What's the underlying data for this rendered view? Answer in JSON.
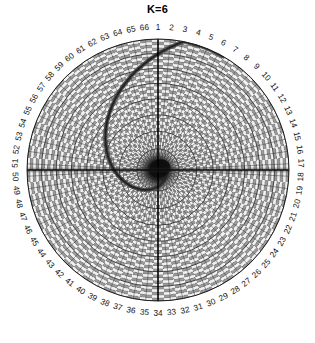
{
  "chart_data": {
    "type": "heatmap",
    "subtype": "polar-spiral-grid",
    "title": "K=6",
    "xlabel": "",
    "ylabel": "",
    "legend": null,
    "grid": true,
    "angular_axis": {
      "label": "",
      "direction": "clockwise",
      "zero_at": "top",
      "n_sectors": 66,
      "tick_labels": [
        "1",
        "2",
        "3",
        "4",
        "5",
        "6",
        "7",
        "8",
        "9",
        "10",
        "11",
        "12",
        "13",
        "14",
        "15",
        "16",
        "17",
        "18",
        "19",
        "20",
        "21",
        "22",
        "23",
        "24",
        "25",
        "26",
        "27",
        "28",
        "29",
        "30",
        "31",
        "32",
        "33",
        "34",
        "35",
        "36",
        "37",
        "38",
        "39",
        "40",
        "41",
        "42",
        "43",
        "44",
        "45",
        "46",
        "47",
        "48",
        "49",
        "50",
        "51",
        "52",
        "53",
        "54",
        "55",
        "56",
        "57",
        "58",
        "59",
        "60",
        "61",
        "62",
        "63",
        "64",
        "65",
        "66"
      ]
    },
    "radial_axis": {
      "label": "",
      "rlim": [
        0,
        1
      ],
      "n_rings": 40,
      "tick_labels": []
    },
    "annotations": [
      {
        "name": "dark-core",
        "description": "dark saturated region at pole",
        "r": 0.1
      },
      {
        "name": "spiral-arm",
        "description": "dark logarithmic spiral emanating clockwise from pole to rim"
      },
      {
        "name": "horizontal-axis-band",
        "description": "emphasized horizontal line across sectors 17-18 and 50-51"
      },
      {
        "name": "vertical-axis-line",
        "description": "emphasized vertical line across sectors 1 and 34"
      }
    ],
    "series": [
      {
        "name": "spiral",
        "type": "spiral",
        "turns": 1.08,
        "a": 0.018,
        "b": 0.62,
        "theta_start_deg": 0,
        "theta_end_deg": 390,
        "color": "#3a3a3a"
      }
    ],
    "colors": {
      "background": "#ffffff",
      "grid": "#2b2b2b",
      "cell_light": "#f2f2f2",
      "cell_mid": "#9a9a9a",
      "cell_dark": "#2a2a2a",
      "axis": "#000000",
      "text": "#111111"
    }
  }
}
